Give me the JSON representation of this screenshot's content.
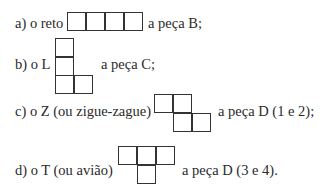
{
  "items": [
    {
      "label": "a) o reto",
      "piece": "a peça B;",
      "shape": "reto"
    },
    {
      "label": "b) o L",
      "piece": "a peça C;",
      "shape": "L"
    },
    {
      "label": "c)  o Z (ou zigue-zague)",
      "piece": "a peça D (1 e 2);",
      "shape": "Z"
    },
    {
      "label": "d)  o T (ou avião)",
      "piece": "a peça D (3 e 4).",
      "shape": "T"
    }
  ]
}
